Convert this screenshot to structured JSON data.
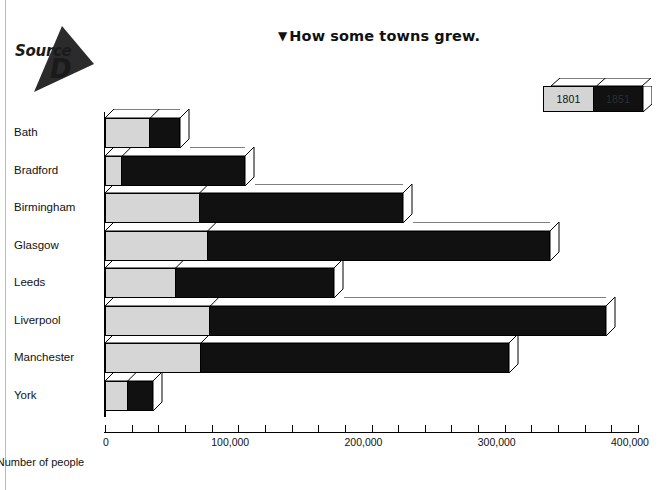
{
  "source_badge": {
    "word": "Source",
    "letter": "D",
    "icon": "down-left-triangle-icon"
  },
  "title": {
    "marker": "▼",
    "text": "How some towns grew."
  },
  "legend": {
    "position": "top-right",
    "entries": [
      {
        "label": "1801",
        "color": "#d6d6d6"
      },
      {
        "label": "1851",
        "color": "#111111"
      }
    ]
  },
  "axis": {
    "x_title": "Number of people",
    "tick_labels": [
      "0",
      "100,000",
      "200,000",
      "300,000",
      "400,000"
    ],
    "tick_values": [
      0,
      100000,
      200000,
      300000,
      400000
    ],
    "minor_tick_step": 20000
  },
  "chart_data": {
    "type": "bar",
    "orientation": "horizontal",
    "title": "How some towns grew.",
    "xlabel": "Number of people",
    "ylabel": "",
    "xlim": [
      0,
      400000
    ],
    "grid": false,
    "legend_position": "top-right",
    "categories": [
      "Bath",
      "Bradford",
      "Birmingham",
      "Glasgow",
      "Leeds",
      "Liverpool",
      "Manchester",
      "York"
    ],
    "series": [
      {
        "name": "1801",
        "color": "#d6d6d6",
        "values": [
          34000,
          13000,
          71000,
          77000,
          53000,
          79000,
          72000,
          17000
        ]
      },
      {
        "name": "1851",
        "color": "#111111",
        "values": [
          56000,
          105000,
          224000,
          334000,
          172000,
          376000,
          303000,
          36000
        ]
      }
    ]
  }
}
